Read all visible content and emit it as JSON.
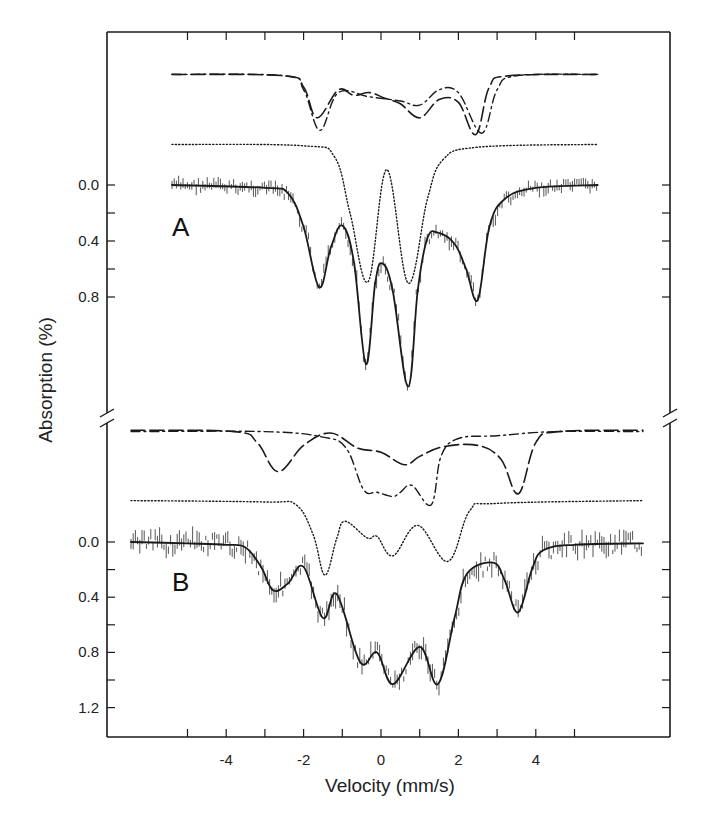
{
  "chart_data": {
    "type": "line",
    "title": "",
    "xlabel": "Velocity (mm/s)",
    "ylabel": "Absorption (%)",
    "x_ticks": [
      -4,
      -2,
      0,
      2,
      4
    ],
    "x_minor_ticks": [
      -5,
      -4,
      -3,
      -2,
      -1,
      0,
      1,
      2,
      3,
      4,
      5
    ],
    "xlim": [
      -7.1,
      7.5
    ],
    "y_axis_break": true,
    "grid": false,
    "legend": "none",
    "panels": [
      {
        "label": "A",
        "y_ticks": [
          "0.0",
          "0.4",
          "0.8"
        ],
        "y_minor_ticks": [
          0.0,
          0.2,
          0.4,
          0.6,
          0.8
        ],
        "series": [
          {
            "name": "spectrum fit (solid) with experimental data",
            "style": "solid",
            "x": [
              -5.4,
              -3.0,
              -2.4,
              -2.0,
              -1.6,
              -1.3,
              -1.0,
              -0.7,
              -0.39,
              -0.15,
              0.03,
              0.3,
              0.7,
              0.95,
              1.2,
              1.47,
              1.9,
              2.2,
              2.5,
              2.8,
              3.2,
              4.0,
              5.6
            ],
            "values": [
              0.0,
              0.02,
              0.06,
              0.3,
              0.73,
              0.45,
              0.29,
              0.55,
              1.28,
              0.7,
              0.56,
              0.75,
              1.44,
              0.75,
              0.38,
              0.34,
              0.42,
              0.6,
              0.82,
              0.3,
              0.1,
              0.02,
              0.0
            ]
          },
          {
            "name": "component doublets (dotted)",
            "style": "dotted",
            "x": [
              -5.4,
              -2.0,
              -1.2,
              -0.8,
              -0.33,
              0.15,
              0.7,
              1.2,
              1.6,
              2.5,
              5.6
            ],
            "values": [
              -0.29,
              -0.28,
              -0.2,
              0.2,
              0.69,
              -0.11,
              0.7,
              0.1,
              -0.18,
              -0.27,
              -0.29
            ]
          },
          {
            "name": "component (long dash)",
            "style": "dashed",
            "x": [
              -5.4,
              -2.5,
              -2.0,
              -1.65,
              -1.1,
              -0.7,
              -0.3,
              0.1,
              0.5,
              1.0,
              1.5,
              2.0,
              2.45,
              2.8,
              3.3,
              5.6
            ],
            "values": [
              -0.79,
              -0.78,
              -0.7,
              -0.48,
              -0.68,
              -0.64,
              -0.66,
              -0.62,
              -0.58,
              -0.48,
              -0.61,
              -0.59,
              -0.36,
              -0.7,
              -0.78,
              -0.79
            ]
          },
          {
            "name": "component (dash-dot)",
            "style": "dashdot",
            "x": [
              -5.4,
              -2.5,
              -2.0,
              -1.58,
              -1.1,
              -0.3,
              0.5,
              1.0,
              1.5,
              2.0,
              2.6,
              3.0,
              3.5,
              5.6
            ],
            "values": [
              -0.79,
              -0.78,
              -0.68,
              -0.39,
              -0.66,
              -0.63,
              -0.6,
              -0.57,
              -0.68,
              -0.66,
              -0.37,
              -0.68,
              -0.78,
              -0.79
            ]
          }
        ]
      },
      {
        "label": "B",
        "y_ticks": [
          "0.0",
          "0.4",
          "0.8",
          "1.2"
        ],
        "y_minor_ticks": [
          0.0,
          0.2,
          0.4,
          0.6,
          0.8,
          1.0,
          1.2
        ],
        "series": [
          {
            "name": "spectrum fit (solid) with experimental data",
            "style": "solid",
            "x": [
              -6.46,
              -5.0,
              -4.0,
              -3.5,
              -3.1,
              -2.79,
              -2.4,
              -2.0,
              -1.5,
              -1.14,
              -0.54,
              -0.1,
              0.31,
              1.0,
              1.47,
              1.9,
              2.22,
              2.9,
              3.2,
              3.54,
              3.9,
              4.19,
              5.0,
              6.77
            ],
            "values": [
              0.0,
              0.01,
              0.02,
              0.04,
              0.18,
              0.35,
              0.3,
              0.18,
              0.55,
              0.38,
              0.87,
              0.8,
              1.03,
              0.76,
              1.03,
              0.55,
              0.23,
              0.15,
              0.28,
              0.51,
              0.2,
              0.06,
              0.02,
              0.01
            ]
          },
          {
            "name": "component doublets (dotted)",
            "style": "dotted",
            "x": [
              -6.46,
              -3.0,
              -2.2,
              -1.75,
              -1.45,
              -1.15,
              -0.93,
              -0.36,
              -0.1,
              0.31,
              0.95,
              1.73,
              2.3,
              3.0,
              6.77
            ],
            "values": [
              -0.3,
              -0.29,
              -0.27,
              -0.05,
              0.24,
              -0.02,
              -0.15,
              -0.03,
              -0.04,
              0.1,
              -0.12,
              0.14,
              -0.23,
              -0.28,
              -0.3
            ]
          },
          {
            "name": "component (long dash)",
            "style": "dashed",
            "x": [
              -6.46,
              -3.8,
              -3.2,
              -2.66,
              -2.0,
              -1.3,
              -0.6,
              0.0,
              0.6,
              1.0,
              1.6,
              2.5,
              3.1,
              3.55,
              4.0,
              4.6,
              6.77
            ],
            "values": [
              -0.81,
              -0.8,
              -0.72,
              -0.51,
              -0.7,
              -0.79,
              -0.68,
              -0.65,
              -0.56,
              -0.62,
              -0.69,
              -0.7,
              -0.6,
              -0.35,
              -0.72,
              -0.8,
              -0.81
            ]
          },
          {
            "name": "component (dash-dot)",
            "style": "dashdot",
            "x": [
              -6.46,
              -3.0,
              -1.5,
              -0.9,
              -0.45,
              -0.1,
              0.3,
              0.5,
              0.8,
              1.3,
              1.55,
              2.0,
              3.0,
              4.5,
              6.77
            ],
            "values": [
              -0.8,
              -0.8,
              -0.76,
              -0.68,
              -0.38,
              -0.36,
              -0.33,
              -0.36,
              -0.41,
              -0.27,
              -0.62,
              -0.75,
              -0.77,
              -0.8,
              -0.8
            ]
          }
        ]
      }
    ]
  },
  "labels": {
    "panel_a": "A",
    "panel_b": "B",
    "x_axis_title": "Velocity (mm/s)",
    "y_axis_title": "Absorption (%)"
  },
  "colors": {
    "ink": "#1a1a1a",
    "data_bars": "#555555",
    "background": "#ffffff"
  }
}
